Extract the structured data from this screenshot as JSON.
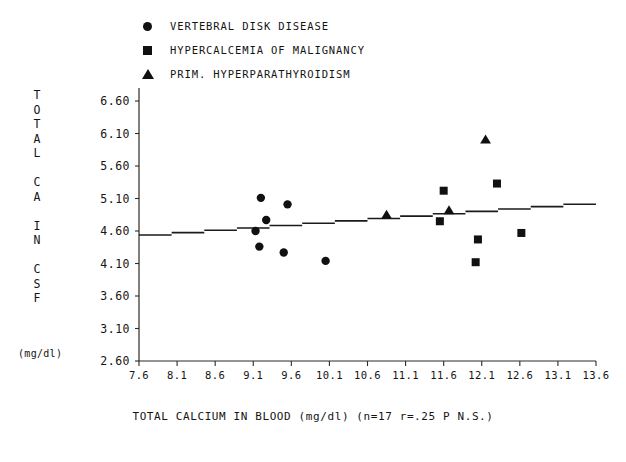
{
  "legend": {
    "items": [
      {
        "marker": "circle-marker-icon",
        "label": "VERTEBRAL DISK DISEASE"
      },
      {
        "marker": "square-marker-icon",
        "label": "HYPERCALCEMIA OF MALIGNANCY"
      },
      {
        "marker": "triangle-marker-icon",
        "label": "PRIM. HYPERPARATHYROIDISM"
      }
    ]
  },
  "yaxis_caption": {
    "lines": [
      "T",
      "O",
      "T",
      "A",
      "L",
      "",
      "C",
      "A",
      "",
      "I",
      "N",
      "",
      "C",
      "S",
      "F"
    ],
    "unit": "(mg/dl)"
  },
  "xtitle": "TOTAL CALCIUM IN BLOOD (mg/dl) (n=17 r=.25 P N.S.)",
  "chart_data": {
    "type": "scatter",
    "title": "",
    "xlabel": "TOTAL CALCIUM IN BLOOD (mg/dl) (n=17 r=.25 P N.S.)",
    "ylabel": "TOTAL CA IN CSF (mg/dl)",
    "xlim": [
      7.6,
      13.6
    ],
    "ylim": [
      2.6,
      6.6
    ],
    "xticks": [
      7.6,
      8.1,
      8.6,
      9.1,
      9.6,
      10.1,
      10.6,
      11.1,
      11.6,
      12.1,
      12.6,
      13.1,
      13.6
    ],
    "yticks": [
      2.6,
      3.1,
      3.6,
      4.1,
      4.6,
      5.1,
      5.6,
      6.1,
      6.6
    ],
    "xticklabels": [
      "7.6",
      "8.1",
      "8.6",
      "9.1",
      "9.6",
      "10.1",
      "10.6",
      "11.1",
      "11.6",
      "12.1",
      "12.6",
      "13.1",
      "13.6"
    ],
    "yticklabels": [
      "2.60",
      "3.10",
      "3.60",
      "4.10",
      "4.60",
      "5.10",
      "5.60",
      "6.10",
      "6.60"
    ],
    "grid": false,
    "legend_position": "top-left-outside",
    "n": 17,
    "r": 0.25,
    "significance": "P N.S.",
    "trendline": {
      "x": [
        7.6,
        13.6
      ],
      "y": [
        4.52,
        5.03
      ]
    },
    "series": [
      {
        "name": "VERTEBRAL DISK DISEASE",
        "marker": "circle",
        "color": "#111111",
        "points": [
          {
            "x": 9.2,
            "y": 5.11
          },
          {
            "x": 9.55,
            "y": 5.01
          },
          {
            "x": 9.27,
            "y": 4.77
          },
          {
            "x": 9.13,
            "y": 4.6
          },
          {
            "x": 9.18,
            "y": 4.36
          },
          {
            "x": 9.5,
            "y": 4.27
          },
          {
            "x": 10.05,
            "y": 4.14
          }
        ]
      },
      {
        "name": "HYPERCALCEMIA OF MALIGNANCY",
        "marker": "square",
        "color": "#111111",
        "points": [
          {
            "x": 11.6,
            "y": 5.22
          },
          {
            "x": 12.3,
            "y": 5.33
          },
          {
            "x": 11.55,
            "y": 4.75
          },
          {
            "x": 12.05,
            "y": 4.47
          },
          {
            "x": 12.62,
            "y": 4.57
          },
          {
            "x": 12.02,
            "y": 4.12
          }
        ]
      },
      {
        "name": "PRIM. HYPERPARATHYROIDISM",
        "marker": "triangle",
        "color": "#111111",
        "points": [
          {
            "x": 12.15,
            "y": 6.0
          },
          {
            "x": 10.85,
            "y": 4.84
          },
          {
            "x": 11.67,
            "y": 4.91
          }
        ]
      }
    ]
  }
}
